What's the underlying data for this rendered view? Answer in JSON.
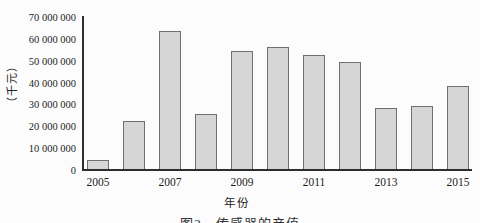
{
  "chart_data": {
    "type": "bar",
    "title": "",
    "categories": [
      "2005",
      "2006",
      "2007",
      "2008",
      "2009",
      "2010",
      "2011",
      "2012",
      "2013",
      "2014",
      "2015"
    ],
    "values": [
      4000000,
      22000000,
      63000000,
      25000000,
      54000000,
      56000000,
      52000000,
      49000000,
      28000000,
      29000000,
      38000000
    ],
    "xlabel": "年份",
    "ylabel": "（千元）",
    "ylim": [
      0,
      70000000
    ],
    "ytick_step": 10000000,
    "ytick_labels": [
      "0",
      "10 000 000",
      "20 000 000",
      "30 000 000",
      "40 000 000",
      "50 000 000",
      "60 000 000",
      "70 000 000"
    ],
    "xtick_labels": [
      "2005",
      "2007",
      "2009",
      "2011",
      "2013",
      "2015"
    ],
    "grid": false,
    "legend": false,
    "bar_fill": "#d6d6d6",
    "bar_border": "#6f6f6f",
    "axis_color": "#2e2e2e"
  },
  "caption": {
    "text": "图2　传感器的产值"
  }
}
